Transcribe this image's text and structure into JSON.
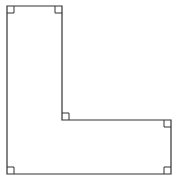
{
  "diagram": {
    "type": "L-shaped polygon with right-angle markers",
    "stroke_color": "#333333",
    "background": "#ffffff",
    "vertices": [
      {
        "name": "top-left",
        "x": 7,
        "y": 6
      },
      {
        "name": "top-right",
        "x": 62,
        "y": 6
      },
      {
        "name": "inner-corner",
        "x": 62,
        "y": 120
      },
      {
        "name": "right-top",
        "x": 171,
        "y": 120
      },
      {
        "name": "bottom-right",
        "x": 171,
        "y": 174
      },
      {
        "name": "bottom-left",
        "x": 7,
        "y": 174
      }
    ],
    "right_angle_markers": [
      {
        "name": "top-left",
        "x": 7,
        "y": 6,
        "dx": 1,
        "dy": 1
      },
      {
        "name": "top-right",
        "x": 62,
        "y": 6,
        "dx": -1,
        "dy": 1
      },
      {
        "name": "inner-corner",
        "x": 62,
        "y": 120,
        "dx": 1,
        "dy": -1
      },
      {
        "name": "right-top",
        "x": 171,
        "y": 120,
        "dx": -1,
        "dy": 1
      },
      {
        "name": "bottom-right",
        "x": 171,
        "y": 174,
        "dx": -1,
        "dy": -1
      },
      {
        "name": "bottom-left",
        "x": 7,
        "y": 174,
        "dx": 1,
        "dy": -1
      }
    ],
    "marker_size": 7
  }
}
